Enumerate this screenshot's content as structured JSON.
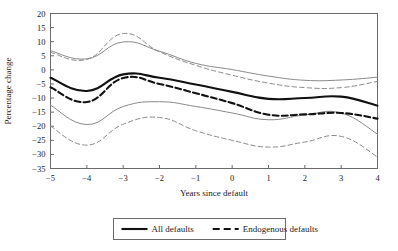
{
  "chart_data": {
    "type": "line",
    "title": "",
    "xlabel": "Years since default",
    "ylabel": "Percentage change",
    "xlim": [
      -5,
      4
    ],
    "ylim": [
      -35,
      20
    ],
    "xticks": [
      -5,
      -4,
      -3,
      -2,
      -1,
      0,
      1,
      2,
      3,
      4
    ],
    "xticklabels": [
      "−5",
      "−4",
      "−3",
      "−2",
      "−1",
      "0",
      "1",
      "2",
      "3",
      "4"
    ],
    "yticks": [
      20,
      15,
      10,
      5,
      0,
      -5,
      -10,
      -15,
      -20,
      -25,
      -30,
      -35
    ],
    "yticklabels": [
      "20",
      "15",
      "10",
      "5",
      "0",
      "−5",
      "−10",
      "−15",
      "−20",
      "−25",
      "−30",
      "−35"
    ],
    "grid": false,
    "legend_position": "below-center",
    "x": [
      -5,
      -4,
      -3,
      -2,
      -1,
      0,
      1,
      2,
      3,
      4
    ],
    "series": [
      {
        "name": "All defaults",
        "role": "point-estimate",
        "style": "solid",
        "color": "#111111",
        "width": 2.1,
        "values": [
          -2.8,
          -7.5,
          -1.6,
          -2.8,
          -5.2,
          -7.8,
          -10.3,
          -10.0,
          -9.5,
          -12.7
        ]
      },
      {
        "name": "All defaults upper band",
        "role": "confidence-upper",
        "style": "solid",
        "color": "#8a8a8a",
        "width": 1.0,
        "values": [
          6.8,
          3.9,
          9.9,
          6.6,
          2.3,
          0.1,
          -2.2,
          -3.7,
          -3.6,
          -2.6
        ]
      },
      {
        "name": "All defaults lower band",
        "role": "confidence-lower",
        "style": "solid",
        "color": "#8a8a8a",
        "width": 1.0,
        "values": [
          -12.5,
          -19.4,
          -13.0,
          -11.3,
          -13.0,
          -15.3,
          -17.7,
          -16.0,
          -15.3,
          -22.8
        ]
      },
      {
        "name": "Endogenous defaults",
        "role": "point-estimate",
        "style": "dashed",
        "color": "#111111",
        "width": 2.1,
        "values": [
          -6.2,
          -11.4,
          -2.9,
          -5.0,
          -8.3,
          -11.8,
          -15.9,
          -15.8,
          -15.3,
          -17.3
        ]
      },
      {
        "name": "Endogenous defaults upper band",
        "role": "confidence-upper",
        "style": "dashed",
        "color": "#8a8a8a",
        "width": 1.0,
        "values": [
          6.2,
          3.7,
          12.9,
          6.4,
          1.6,
          -1.9,
          -4.7,
          -6.3,
          -6.3,
          -4.1
        ]
      },
      {
        "name": "Endogenous defaults lower band",
        "role": "confidence-lower",
        "style": "dashed",
        "color": "#8a8a8a",
        "width": 1.0,
        "values": [
          -20.0,
          -26.7,
          -19.3,
          -16.9,
          -21.6,
          -25.0,
          -27.4,
          -25.6,
          -23.6,
          -30.9
        ]
      }
    ],
    "legend": [
      {
        "label": "All defaults",
        "style": "solid",
        "color": "#111111"
      },
      {
        "label": "Endogenous defaults",
        "style": "dashed",
        "color": "#111111"
      }
    ],
    "colors": {
      "estimate": "#111111",
      "band": "#8a8a8a",
      "axis": "#6b6b6b",
      "background": "#ffffff"
    }
  }
}
